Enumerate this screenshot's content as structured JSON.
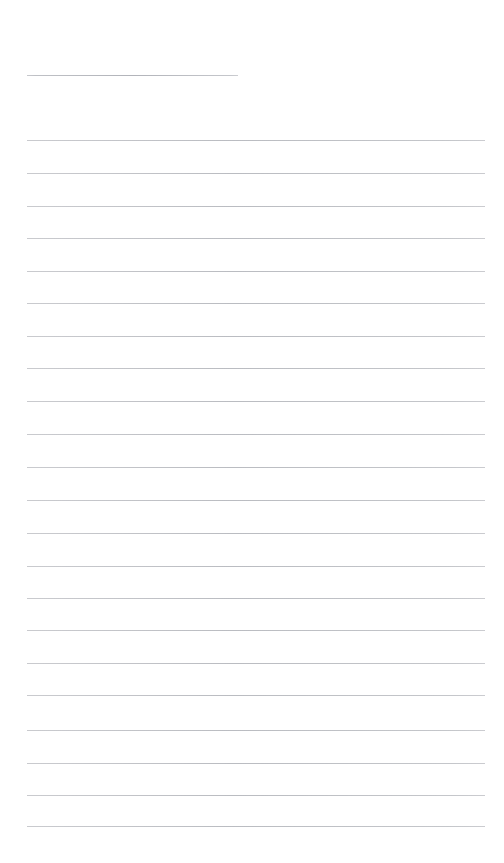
{
  "document": {
    "kind": "lined-notepad-page",
    "page_width": 504,
    "page_height": 863,
    "page_background": "#ffffff",
    "rule_color": "#c9cace",
    "rule_thickness": 1,
    "content_left": 27,
    "content_right": 485,
    "line_spacing": 32.5,
    "title_text": "",
    "title_rule": {
      "x": 27,
      "y": 75,
      "width": 211,
      "length_label": "short"
    },
    "body_first_line_y": 140,
    "body_last_line_y": 826,
    "body_line_count": 22,
    "body_lines": [
      {
        "y": 140,
        "text": ""
      },
      {
        "y": 173,
        "text": ""
      },
      {
        "y": 206,
        "text": ""
      },
      {
        "y": 238,
        "text": ""
      },
      {
        "y": 271,
        "text": ""
      },
      {
        "y": 303,
        "text": ""
      },
      {
        "y": 336,
        "text": ""
      },
      {
        "y": 368,
        "text": ""
      },
      {
        "y": 401,
        "text": ""
      },
      {
        "y": 434,
        "text": ""
      },
      {
        "y": 467,
        "text": ""
      },
      {
        "y": 500,
        "text": ""
      },
      {
        "y": 533,
        "text": ""
      },
      {
        "y": 566,
        "text": ""
      },
      {
        "y": 598,
        "text": ""
      },
      {
        "y": 630,
        "text": ""
      },
      {
        "y": 663,
        "text": ""
      },
      {
        "y": 695,
        "text": ""
      },
      {
        "y": 730,
        "text": ""
      },
      {
        "y": 763,
        "text": ""
      },
      {
        "y": 795,
        "text": ""
      },
      {
        "y": 826,
        "text": ""
      }
    ]
  }
}
